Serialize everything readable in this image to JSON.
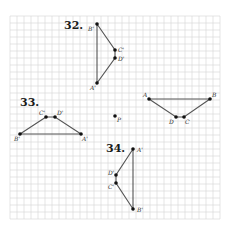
{
  "problems": [
    {
      "number": "32.",
      "points": [
        {
          "label": "B'",
          "x": 0,
          "y": 0
        },
        {
          "label": "C'",
          "x": 2.5,
          "y": 3.7
        },
        {
          "label": "D'",
          "x": 2.5,
          "y": 4.8
        },
        {
          "label": "A'",
          "x": 0,
          "y": 8.4
        }
      ],
      "segments": [
        [
          "B'",
          "C'"
        ],
        [
          "C'",
          "D'"
        ],
        [
          "D'",
          "A'"
        ],
        [
          "A'",
          "B'"
        ]
      ]
    },
    {
      "number": "33.",
      "points": [
        {
          "label": "C'",
          "x": 0,
          "y": 0
        },
        {
          "label": "D'",
          "x": 1.3,
          "y": 0
        },
        {
          "label": "B'",
          "x": -3.7,
          "y": 2.4
        },
        {
          "label": "A'",
          "x": 5.0,
          "y": 2.4
        }
      ],
      "segments": [
        [
          "C'",
          "D'"
        ],
        [
          "D'",
          "A'"
        ],
        [
          "A'",
          "B'"
        ],
        [
          "B'",
          "C'"
        ]
      ]
    },
    {
      "number": "34.",
      "points": [
        {
          "label": "A'",
          "x": 0,
          "y": 0
        },
        {
          "label": "D'",
          "x": -2.4,
          "y": 3.7
        },
        {
          "label": "C'",
          "x": -2.4,
          "y": 4.8
        },
        {
          "label": "B'",
          "x": 0,
          "y": 8.5
        }
      ],
      "segments": [
        [
          "A'",
          "D'"
        ],
        [
          "D'",
          "C'"
        ],
        [
          "C'",
          "B'"
        ],
        [
          "B'",
          "A'"
        ]
      ]
    }
  ],
  "original_figure": {
    "points": [
      {
        "label": "A"
      },
      {
        "label": "B"
      },
      {
        "label": "D"
      },
      {
        "label": "C"
      }
    ],
    "segments": [
      [
        "A",
        "B"
      ],
      [
        "B",
        "C"
      ],
      [
        "C",
        "D"
      ],
      [
        "D",
        "A"
      ]
    ]
  },
  "center_point": {
    "label": "P"
  }
}
